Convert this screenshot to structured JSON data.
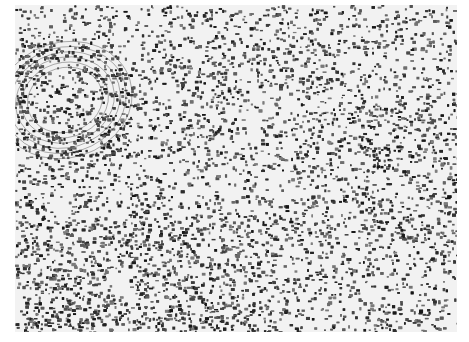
{
  "image": {
    "subject": "histology micrograph",
    "description": "Grayscale tissue section with dense scattered dark nuclei; a concentric whorled structure at upper-left and denser cellular region at lower-left",
    "colors": {
      "background": "#ffffff",
      "tissue_light": "#f2f2f2",
      "nucleus_dark": "#1a1a1a"
    }
  }
}
